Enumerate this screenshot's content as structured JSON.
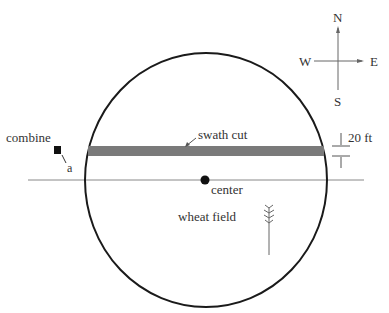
{
  "diagram": {
    "labels": {
      "combine": "combine",
      "combine_point": "a",
      "swath": "swath cut",
      "width": "20 ft",
      "center": "center",
      "field": "wheat field"
    },
    "compass": {
      "north": "N",
      "south": "S",
      "east": "E",
      "west": "W"
    },
    "colors": {
      "swath": "#7a7a7a",
      "outline": "#1a1a1a",
      "line": "#888888"
    }
  }
}
